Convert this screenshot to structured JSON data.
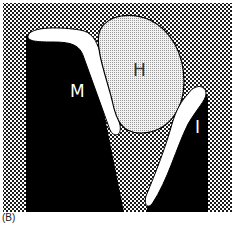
{
  "figure": {
    "panel_label": "(B)",
    "labels": {
      "m": "M",
      "h": "H",
      "i": "I"
    },
    "colors": {
      "background_pattern_dark": "#111111",
      "background_pattern_light": "#ffffff",
      "solid_structure": "#000000",
      "white_band": "#ffffff",
      "blob_fill": "#e8e8e8",
      "label_dark": "#333333",
      "label_light": "#ffffff"
    }
  }
}
